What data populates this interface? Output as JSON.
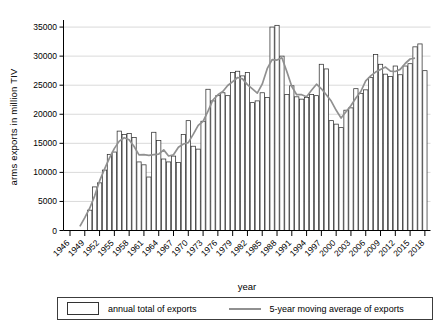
{
  "figure": {
    "colors": {
      "background": "#ffffff",
      "axis": "#000000",
      "grid": "#dadada",
      "bar_fill": "#ffffff",
      "bar_stroke": "#2f2f2f",
      "line": "#909090",
      "text": "#000000"
    }
  },
  "chart_data": {
    "type": "bar",
    "title": "",
    "xlabel": "year",
    "ylabel": "arms exports in million TIV",
    "ylim": [
      0,
      35000
    ],
    "yticks": [
      0,
      5000,
      10000,
      15000,
      20000,
      25000,
      30000,
      35000
    ],
    "xticks": [
      1946,
      1949,
      1952,
      1955,
      1958,
      1961,
      1964,
      1967,
      1970,
      1973,
      1976,
      1979,
      1982,
      1985,
      1988,
      1991,
      1994,
      1997,
      2000,
      2003,
      2006,
      2009,
      2012,
      2015,
      2018
    ],
    "grid": "horizontal",
    "legend_position": "bottom",
    "years": [
      1946,
      1947,
      1948,
      1949,
      1950,
      1951,
      1952,
      1953,
      1954,
      1955,
      1956,
      1957,
      1958,
      1959,
      1960,
      1961,
      1962,
      1963,
      1964,
      1965,
      1966,
      1967,
      1968,
      1969,
      1970,
      1971,
      1972,
      1973,
      1974,
      1975,
      1976,
      1977,
      1978,
      1979,
      1980,
      1981,
      1982,
      1983,
      1984,
      1985,
      1986,
      1987,
      1988,
      1989,
      1990,
      1991,
      1992,
      1993,
      1994,
      1995,
      1996,
      1997,
      1998,
      1999,
      2000,
      2001,
      2002,
      2003,
      2004,
      2005,
      2006,
      2007,
      2008,
      2009,
      2010,
      2011,
      2012,
      2013,
      2014,
      2015,
      2016,
      2017,
      2018
    ],
    "series": [
      {
        "name": "annual total of exports",
        "kind": "bar",
        "year_start": 1946,
        "values": [
          0,
          0,
          0,
          0,
          3500,
          7500,
          8200,
          10400,
          13100,
          13500,
          17100,
          16500,
          16700,
          16000,
          11800,
          11300,
          9200,
          16900,
          15500,
          12300,
          11800,
          12800,
          11700,
          16500,
          18900,
          14500,
          14000,
          18800,
          24300,
          22300,
          23200,
          23700,
          23200,
          27200,
          27400,
          26600,
          27200,
          22000,
          22300,
          23700,
          22900,
          35000,
          35300,
          30000,
          23400,
          24900,
          23000,
          22600,
          22900,
          23400,
          23200,
          28600,
          27800,
          18900,
          18300,
          17700,
          20700,
          21100,
          24400,
          23600,
          24200,
          26300,
          30300,
          28600,
          26900,
          26500,
          28300,
          26800,
          28300,
          28700,
          31600,
          32100,
          27500
        ]
      },
      {
        "name": "5-year moving average of exports",
        "kind": "line",
        "year_start": 1948,
        "values": [
          700,
          2200,
          3840,
          5920,
          8540,
          10540,
          12460,
          14120,
          15380,
          15960,
          15620,
          14460,
          13000,
          13040,
          12940,
          13040,
          13140,
          13860,
          12820,
          13020,
          14340,
          14880,
          15120,
          16540,
          18100,
          18780,
          20520,
          22460,
          23340,
          23920,
          24940,
          25620,
          26320,
          26080,
          25100,
          24360,
          23620,
          25180,
          27840,
          29380,
          29320,
          29720,
          27320,
          24780,
          23360,
          23360,
          23020,
          24140,
          25180,
          24380,
          23360,
          22260,
          20680,
          19340,
          20440,
          21500,
          22800,
          23920,
          25760,
          26600,
          27260,
          27720,
          28120,
          27420,
          27360,
          27720,
          28740,
          29500,
          29640
        ]
      }
    ]
  }
}
